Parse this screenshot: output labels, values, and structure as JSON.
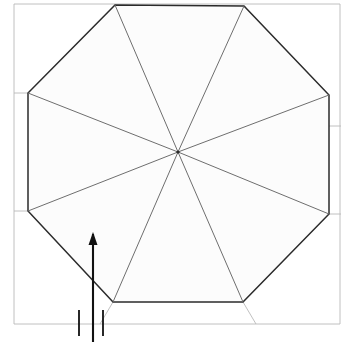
{
  "figure": {
    "title": "Octagonal plan line drawing with radiating diagonals and direction arrow",
    "caption": "",
    "canvas": {
      "width": 341,
      "height": 342
    },
    "background_color": "#ffffff",
    "stroke_colors": {
      "primary": "#2b2b2b",
      "secondary": "#6e6e6e",
      "faint": "#b9b9b9",
      "fill": "#fcfcfc"
    },
    "stroke_widths": {
      "primary": 1.5,
      "secondary": 1.0,
      "faint": 0.9
    }
  },
  "geometry": {
    "center_point": {
      "label": "center",
      "x": 178,
      "y": 152
    },
    "octagon": {
      "label": "octagon-outline",
      "vertices": [
        {
          "name": "top-left",
          "x": 115,
          "y": 5
        },
        {
          "name": "top-right",
          "x": 244,
          "y": 6
        },
        {
          "name": "right-upper",
          "x": 329,
          "y": 95
        },
        {
          "name": "right-lower",
          "x": 329,
          "y": 214
        },
        {
          "name": "bottom-right",
          "x": 243,
          "y": 302
        },
        {
          "name": "bottom-left",
          "x": 113,
          "y": 302
        },
        {
          "name": "left-lower",
          "x": 28,
          "y": 211
        },
        {
          "name": "left-upper",
          "x": 28,
          "y": 93
        }
      ]
    },
    "radials": [
      {
        "name": "radial-to-top-left",
        "to_vertex": "top-left"
      },
      {
        "name": "radial-to-top-right",
        "to_vertex": "top-right"
      },
      {
        "name": "radial-to-right-upper",
        "to_vertex": "right-upper"
      },
      {
        "name": "radial-to-right-lower",
        "to_vertex": "right-lower"
      },
      {
        "name": "radial-to-bottom-right",
        "to_vertex": "bottom-right"
      },
      {
        "name": "radial-to-bottom-left",
        "to_vertex": "bottom-left"
      },
      {
        "name": "radial-to-left-lower",
        "to_vertex": "left-lower"
      },
      {
        "name": "radial-to-left-upper",
        "to_vertex": "left-upper"
      }
    ],
    "frame": {
      "label": "outer-frame",
      "left": 14,
      "top": 4,
      "right": 340,
      "bottom": 324
    },
    "construction_lines": [
      {
        "name": "vertical-guide-right",
        "x1": 245,
        "y1": 6,
        "x2": 245,
        "y2": 126
      },
      {
        "name": "horizontal-guide-right",
        "x1": 245,
        "y1": 126,
        "x2": 341,
        "y2": 126
      },
      {
        "name": "horizontal-guide-left",
        "x1": 14,
        "y1": 93,
        "x2": 28,
        "y2": 93
      },
      {
        "name": "horizontal-guide-left-lower",
        "x1": 14,
        "y1": 211,
        "x2": 28,
        "y2": 211
      },
      {
        "name": "horizontal-guide-right-lower",
        "x1": 329,
        "y1": 214,
        "x2": 341,
        "y2": 214
      },
      {
        "name": "bottom-extension-left",
        "x1": 113,
        "y1": 302,
        "x2": 100,
        "y2": 324
      },
      {
        "name": "bottom-extension-right",
        "x1": 243,
        "y1": 302,
        "x2": 256,
        "y2": 324
      }
    ]
  },
  "annotations": {
    "arrow": {
      "name": "direction-arrow",
      "orientation": "up",
      "tail": {
        "x": 93,
        "y": 342
      },
      "head": {
        "x": 93,
        "y": 232
      },
      "head_width": 9,
      "head_length": 13
    },
    "tick_marks": [
      {
        "name": "tick-left",
        "x": 79,
        "y_top": 310,
        "y_bottom": 336
      },
      {
        "name": "tick-right",
        "x": 103,
        "y_top": 310,
        "y_bottom": 336
      }
    ]
  }
}
